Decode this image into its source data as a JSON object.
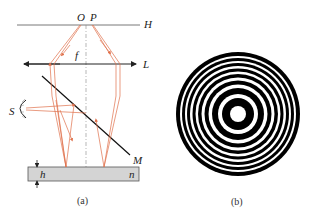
{
  "figure_a": {
    "caption": "(a)",
    "labels": {
      "O": "O",
      "P": "P",
      "H": "H",
      "f": "f",
      "L": "L",
      "S": "S",
      "M": "M",
      "h": "h",
      "n": "n"
    },
    "colors": {
      "ray": "#e0704a",
      "line": "#222222",
      "slab_fill": "#d4d4d4",
      "axis": "#888888"
    }
  },
  "figure_b": {
    "caption": "(b)",
    "description": "concentric interference fringes (rings)",
    "center": [
      238,
      114
    ],
    "outer_radius": 62,
    "colors": {
      "dark": "#000000",
      "light": "#ffffff"
    }
  }
}
